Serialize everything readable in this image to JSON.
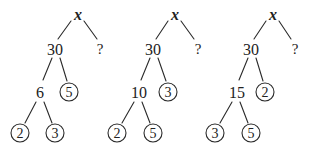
{
  "figure": {
    "colors": {
      "ink": "#222222",
      "background": "#ffffff"
    },
    "trees": [
      {
        "root": "x",
        "unknown": "?",
        "product": "30",
        "composite": "6",
        "composite_prime": "5",
        "leaves": [
          "2",
          "3"
        ]
      },
      {
        "root": "x",
        "unknown": "?",
        "product": "30",
        "composite": "10",
        "composite_prime": "3",
        "leaves": [
          "2",
          "5"
        ]
      },
      {
        "root": "x",
        "unknown": "?",
        "product": "30",
        "composite": "15",
        "composite_prime": "2",
        "leaves": [
          "3",
          "5"
        ]
      }
    ]
  }
}
